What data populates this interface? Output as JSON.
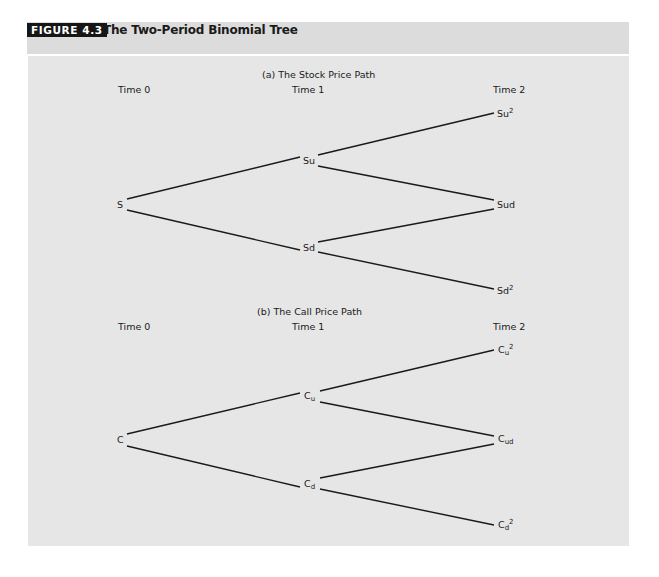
{
  "figure": {
    "badge": "FIGURE 4.3",
    "title": "The Two-Period Binomial Tree"
  },
  "panels": [
    {
      "title": "(a) The Stock Price Path",
      "time_labels": [
        "Time 0",
        "Time 1",
        "Time 2"
      ],
      "nodes": {
        "root": "S",
        "up": "Su",
        "down": "Sd",
        "upup_base": "Su",
        "upup_sup": "2",
        "updown": "Sud",
        "downdown_base": "Sd",
        "downdown_sup": "2"
      }
    },
    {
      "title": "(b) The Call Price Path",
      "time_labels": [
        "Time 0",
        "Time 1",
        "Time 2"
      ],
      "nodes": {
        "root": "C",
        "up_base": "C",
        "up_sub": "u",
        "down_base": "C",
        "down_sub": "d",
        "upup_base": "C",
        "upup_sub": "u",
        "upup_sup": "2",
        "updown_base": "C",
        "updown_sub": "ud",
        "downdown_base": "C",
        "downdown_sub": "d",
        "downdown_sup": "2"
      }
    }
  ],
  "colors": {
    "header_band": "#dcdcdc",
    "badge_bg": "#161616",
    "panel_bg": "#e6e6e6",
    "line": "#1a1a1a"
  }
}
